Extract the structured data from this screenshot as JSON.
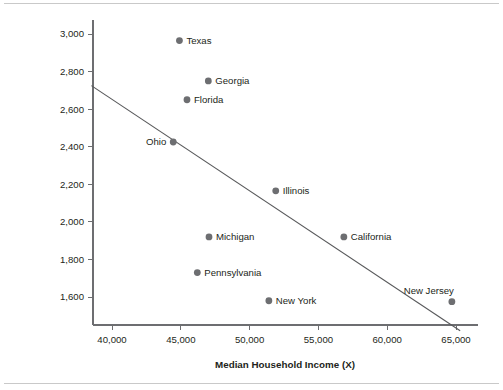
{
  "chart_data": {
    "type": "scatter",
    "title": "",
    "xlabel": "Median Household Income (X)",
    "ylabel": "Larceny/Theft Crime Rates per 100,000 Population (Y)",
    "ylabel_line1": "Larceny/Theft Crime Rates per",
    "ylabel_line2": "100,000 Population (Y)",
    "xlim": [
      38500,
      66500
    ],
    "ylim": [
      1420,
      3070
    ],
    "xticks": [
      40000,
      45000,
      50000,
      55000,
      60000,
      65000
    ],
    "xtick_labels": [
      "40,000",
      "45,000",
      "50,000",
      "55,000",
      "60,000",
      "65,000"
    ],
    "yticks": [
      1600,
      1800,
      2000,
      2200,
      2400,
      2600,
      2800,
      3000
    ],
    "ytick_labels": [
      "1,600",
      "1,800",
      "2,000",
      "2,200",
      "2,400",
      "2,600",
      "2,800",
      "3,000"
    ],
    "grid": false,
    "legend": "none",
    "marker_color": "#6d6e71",
    "line_color": "#58595b",
    "axis_color": "#6d6e71",
    "points": [
      {
        "label": "Texas",
        "x": 44900,
        "y": 2965,
        "label_side": "right"
      },
      {
        "label": "Georgia",
        "x": 47000,
        "y": 2750,
        "label_side": "right"
      },
      {
        "label": "Florida",
        "x": 45450,
        "y": 2650,
        "label_side": "right"
      },
      {
        "label": "Ohio",
        "x": 44450,
        "y": 2425,
        "label_side": "left"
      },
      {
        "label": "Illinois",
        "x": 51900,
        "y": 2165,
        "label_side": "right"
      },
      {
        "label": "Michigan",
        "x": 47050,
        "y": 1920,
        "label_side": "right"
      },
      {
        "label": "California",
        "x": 56850,
        "y": 1920,
        "label_side": "right"
      },
      {
        "label": "Pennsylvania",
        "x": 46200,
        "y": 1730,
        "label_side": "right"
      },
      {
        "label": "New York",
        "x": 51400,
        "y": 1580,
        "label_side": "right"
      },
      {
        "label": "New Jersey",
        "x": 64700,
        "y": 1575,
        "label_side": "above"
      }
    ],
    "fit_line": {
      "name": "regression-line",
      "x_start": 38500,
      "y_start": 2725,
      "x_end": 65300,
      "y_end": 1420
    }
  }
}
